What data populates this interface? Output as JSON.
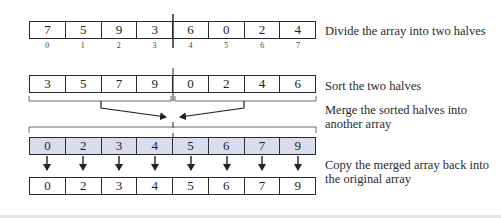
{
  "diagram": {
    "steps": [
      {
        "id": "divide",
        "label": "Divide the array into two halves",
        "values": [
          "7",
          "5",
          "9",
          "3",
          "6",
          "0",
          "2",
          "4"
        ],
        "indices": [
          "0",
          "1",
          "2",
          "3",
          "4",
          "5",
          "6",
          "7"
        ]
      },
      {
        "id": "sort",
        "label": "Sort the two halves",
        "values": [
          "3",
          "5",
          "7",
          "9",
          "0",
          "2",
          "4",
          "6"
        ]
      },
      {
        "id": "merge",
        "label_line1": "Merge the sorted halves into",
        "label_line2": "another array",
        "values": [
          "0",
          "2",
          "3",
          "4",
          "5",
          "6",
          "7",
          "9"
        ],
        "fill_color": "#d9dcec"
      },
      {
        "id": "copy",
        "label_line1": "Copy the merged array back into",
        "label_line2": "the original array",
        "values": [
          "0",
          "2",
          "3",
          "4",
          "5",
          "6",
          "7",
          "9"
        ]
      }
    ]
  }
}
